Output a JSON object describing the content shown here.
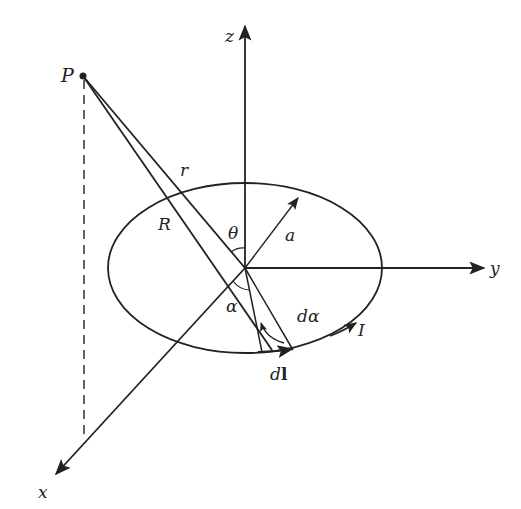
{
  "figure": {
    "axes": {
      "x_label": "x",
      "y_label": "y",
      "z_label": "z"
    },
    "labels": {
      "point": "P",
      "r": "r",
      "R": "R",
      "theta": "θ",
      "a": "a",
      "alpha": "α",
      "dalpha": "dα",
      "current": "I",
      "dl_d": "d",
      "dl_l": "l"
    },
    "colors": {
      "stroke": "#222222",
      "background": "#ffffff"
    }
  }
}
